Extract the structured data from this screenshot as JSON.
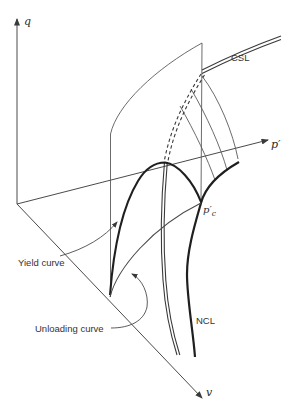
{
  "figure": {
    "background": "#ffffff",
    "thin_line_color": "#4a4a4a",
    "thick_line_color": "#1f1f1f",
    "axes": {
      "vertical_label": "q",
      "horizontal_label": "p′",
      "depth_label": "v"
    },
    "labels": {
      "csl": "CSL",
      "ncl": "NCL",
      "yield_curve": "Yield curve",
      "unloading_curve": "Unloading curve",
      "preconsolidation_main": "p′",
      "preconsolidation_sub": "c"
    }
  }
}
